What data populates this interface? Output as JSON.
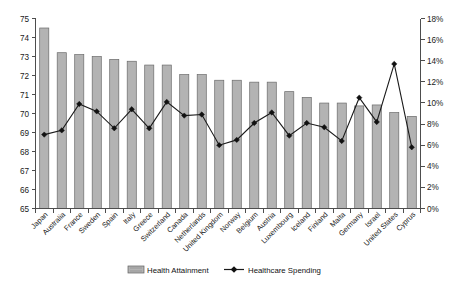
{
  "chart_data": {
    "type": "bar",
    "title": "",
    "subtitle": "",
    "xlabel": "",
    "ylabel": "",
    "grid": false,
    "legend_position": "bottom",
    "categories": [
      "Japan",
      "Australia",
      "France",
      "Sweden",
      "Spain",
      "Italy",
      "Greece",
      "Switzerland",
      "Canada",
      "Netherlands",
      "United Kingdom",
      "Norway",
      "Belgium",
      "Austria",
      "Luxembourg",
      "Iceland",
      "Finland",
      "Malta",
      "Germany",
      "Israel",
      "United States",
      "Cyprus"
    ],
    "series": [
      {
        "name": "Health Attainment",
        "type": "bar",
        "axis": "left",
        "values": [
          74.5,
          73.2,
          73.1,
          73.0,
          72.85,
          72.75,
          72.55,
          72.55,
          72.05,
          72.05,
          71.75,
          71.75,
          71.65,
          71.65,
          71.15,
          70.85,
          70.55,
          70.55,
          70.4,
          70.45,
          70.05,
          69.85
        ]
      },
      {
        "name": "Healthcare Spending",
        "type": "line",
        "axis": "right",
        "values": [
          7.0,
          7.4,
          9.9,
          9.2,
          7.6,
          9.4,
          7.6,
          10.1,
          8.8,
          8.9,
          6.0,
          6.5,
          8.1,
          9.1,
          6.9,
          8.1,
          7.7,
          6.4,
          10.5,
          8.2,
          13.7,
          5.8
        ]
      }
    ],
    "left_axis": {
      "min": 65,
      "max": 75,
      "step": 1,
      "ticks": [
        "65",
        "66",
        "67",
        "68",
        "69",
        "70",
        "71",
        "72",
        "73",
        "74",
        "75"
      ]
    },
    "right_axis": {
      "min": 0,
      "max": 18,
      "step": 2,
      "suffix": "%",
      "ticks": [
        "0%",
        "2%",
        "4%",
        "6%",
        "8%",
        "10%",
        "12%",
        "14%",
        "16%",
        "18%"
      ]
    },
    "colors": {
      "bar_fill": "#b3b3b3",
      "bar_border": "#6b6b6b",
      "line": "#1a1a1a",
      "marker": "#111111",
      "axis": "#4d4d4d",
      "text": "#1a1a1a",
      "background": "#ffffff"
    }
  },
  "legend": {
    "items": [
      {
        "label": "Health Attainment",
        "marker": "bar-swatch"
      },
      {
        "label": "Healthcare Spending",
        "marker": "line-diamond"
      }
    ]
  }
}
